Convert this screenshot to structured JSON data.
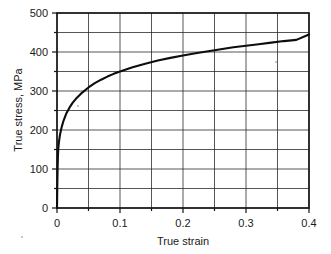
{
  "chart_data": {
    "type": "line",
    "title": "",
    "xlabel": "True strain",
    "ylabel": "True stress, MPa",
    "xlim": [
      0,
      0.4
    ],
    "ylim": [
      0,
      500
    ],
    "grid": true,
    "legend": false,
    "x_major_ticks": [
      0,
      0.1,
      0.2,
      0.3,
      0.4
    ],
    "x_major_tick_labels": [
      "0",
      "0.1",
      "0.2",
      "0.3",
      "0.4"
    ],
    "x_minor_ticks": [
      0.05,
      0.15,
      0.25,
      0.35
    ],
    "x_gridlines": [
      0,
      0.05,
      0.1,
      0.15,
      0.2,
      0.25,
      0.3,
      0.35,
      0.4
    ],
    "y_major_ticks": [
      0,
      100,
      200,
      300,
      400,
      500
    ],
    "y_major_tick_labels": [
      "0",
      "100",
      "200",
      "300",
      "400",
      "500"
    ],
    "y_minor_ticks": [
      50,
      150,
      250,
      350,
      450
    ],
    "y_gridlines": [
      0,
      50,
      100,
      150,
      200,
      250,
      300,
      350,
      400,
      450,
      500
    ],
    "series": [
      {
        "name": "True stress-strain curve",
        "x": [
          0,
          0.0005,
          0.001,
          0.0015,
          0.002,
          0.003,
          0.004,
          0.005,
          0.0075,
          0.01,
          0.015,
          0.02,
          0.025,
          0.03,
          0.04,
          0.05,
          0.06,
          0.07,
          0.08,
          0.09,
          0.1,
          0.12,
          0.14,
          0.16,
          0.18,
          0.2,
          0.22,
          0.24,
          0.26,
          0.28,
          0.3,
          0.32,
          0.34,
          0.36,
          0.38,
          0.4
        ],
        "values": [
          0,
          60,
          105,
          135,
          152,
          168,
          180,
          190,
          208,
          222,
          243,
          258,
          270,
          280,
          296,
          309,
          320,
          329,
          337,
          344,
          350,
          361,
          370,
          378,
          385,
          391,
          397,
          402,
          407,
          412,
          416,
          420,
          424,
          428,
          431,
          445
        ]
      }
    ]
  }
}
